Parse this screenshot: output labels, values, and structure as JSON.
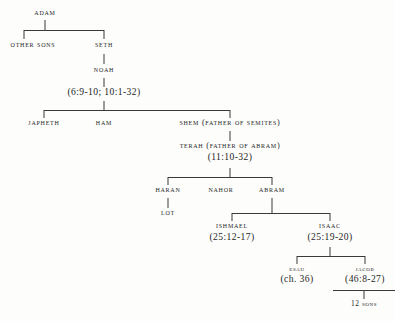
{
  "colors": {
    "background": "#fdfdfb",
    "ink": "#262626",
    "rule": "#3a3a3a"
  },
  "nodes": {
    "adam": {
      "name": "ADAM"
    },
    "other_sons": {
      "name": "OTHER SONS"
    },
    "seth": {
      "name": "SETH"
    },
    "noah": {
      "name": "NOAH"
    },
    "noah_ref": {
      "ref": "(6:9-10;   10:1-32)"
    },
    "japheth": {
      "name": "JAPHETH"
    },
    "ham": {
      "name": "HAM"
    },
    "shem": {
      "name": "SHEM (FATHER OF SEMITES)"
    },
    "terah": {
      "name": "TERAH (FATHER OF ABRAM)",
      "ref": "(11:10-32)"
    },
    "haran": {
      "name": "HARAN"
    },
    "nahor": {
      "name": "NAHOR"
    },
    "abram": {
      "name": "ABRAM"
    },
    "lot": {
      "name": "LOT"
    },
    "ishmael": {
      "name": "ISHMAEL",
      "ref": "(25:12-17)"
    },
    "isaac": {
      "name": "ISAAC",
      "ref": "(25:19-20)"
    },
    "esau": {
      "name": "ESAU",
      "ref": "(ch. 36)"
    },
    "jacob": {
      "name": "JACOB",
      "ref": "(46:8-27)"
    },
    "twelve_sons": {
      "name": "12 SONS"
    }
  }
}
